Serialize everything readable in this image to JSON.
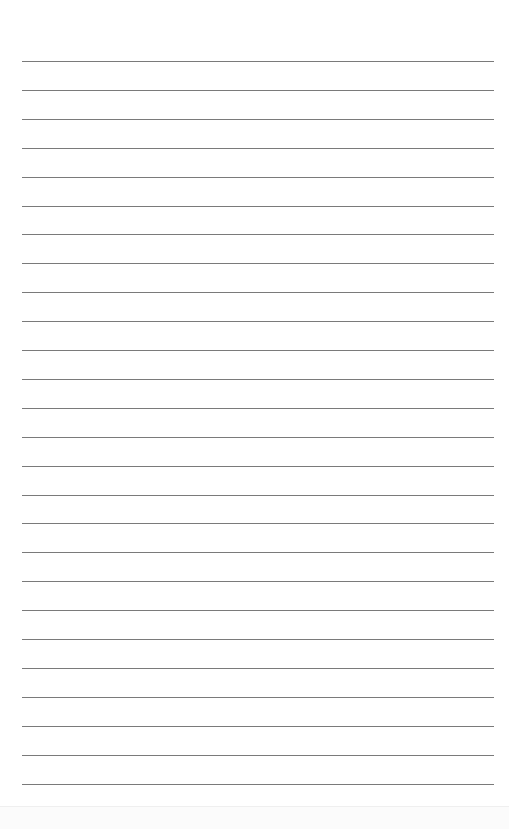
{
  "document": {
    "type": "lined-paper",
    "line_count": 26,
    "first_line_y": 61,
    "line_spacing": 28.9,
    "line_color": "#7a7a7a",
    "background": "#ffffff"
  }
}
